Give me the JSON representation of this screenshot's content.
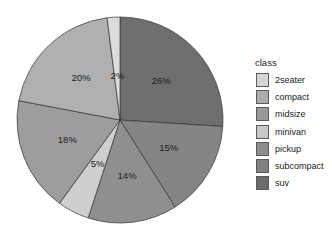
{
  "chart_data": {
    "type": "pie",
    "title": "",
    "legend_title": "class",
    "legend_position": "right",
    "start_angle": "12 o'clock",
    "direction": "clockwise",
    "categories": [
      "2seater",
      "compact",
      "midsize",
      "minivan",
      "pickup",
      "subcompact",
      "suv"
    ],
    "values": [
      2,
      20,
      18,
      5,
      14,
      15,
      26
    ],
    "labels": [
      "2%",
      "20%",
      "18%",
      "5%",
      "14%",
      "15%",
      "26%"
    ],
    "colors": [
      "#dcdcdc",
      "#b0b0b0",
      "#9d9d9d",
      "#cfcfcf",
      "#8f8f8f",
      "#858585",
      "#6e6e6e"
    ],
    "draw_order_clockwise": [
      "suv",
      "subcompact",
      "pickup",
      "minivan",
      "midsize",
      "compact",
      "2seater"
    ]
  },
  "legend": {
    "title": "class",
    "items": [
      {
        "label": "2seater",
        "color": "#d4d4d4"
      },
      {
        "label": "compact",
        "color": "#acacac"
      },
      {
        "label": "midsize",
        "color": "#9a9a9a"
      },
      {
        "label": "minivan",
        "color": "#c9c9c9"
      },
      {
        "label": "pickup",
        "color": "#8d8d8d"
      },
      {
        "label": "subcompact",
        "color": "#818181"
      },
      {
        "label": "suv",
        "color": "#6b6b6b"
      }
    ]
  }
}
